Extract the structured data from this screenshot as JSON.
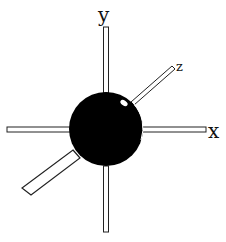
{
  "diagram": {
    "type": "3d-axes-with-sphere",
    "axes": {
      "x_label": "x",
      "y_label": "y",
      "z_label": "z"
    },
    "colors": {
      "sphere": "#000000",
      "rod_fill": "#ffffff",
      "rod_stroke": "#222222",
      "background": "#ffffff"
    }
  }
}
